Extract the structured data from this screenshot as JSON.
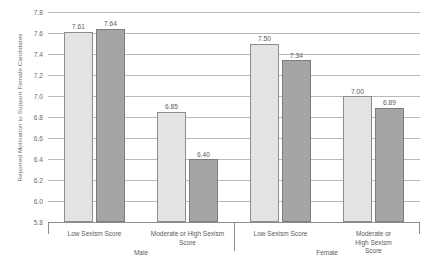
{
  "chart_data": {
    "type": "bar",
    "title": "",
    "xlabel": "",
    "ylabel": "Reported Motivation to Support Female Candidates",
    "ylim": [
      5.8,
      7.8
    ],
    "ytick_step": 0.2,
    "yticks": [
      "7.8",
      "7.6",
      "7.4",
      "7.2",
      "7.0",
      "6.8",
      "6.6",
      "6.4",
      "6.2",
      "6.0",
      "5.8"
    ],
    "ytick_values": [
      7.8,
      7.6,
      7.4,
      7.2,
      7.0,
      6.8,
      6.6,
      6.4,
      6.2,
      6.0,
      5.8
    ],
    "grid": true,
    "legend": "none",
    "categories": [
      "Low Sexism Score",
      "Moderate or High Sexism Score",
      "Low Sexism Score",
      "Moderate or High Sexism Score"
    ],
    "group_labels": [
      "Male",
      "Female"
    ],
    "series": [
      {
        "name": "light",
        "color": "#e3e3e3",
        "values": [
          7.61,
          7.5,
          6.85,
          7.0
        ]
      },
      {
        "name": "dark",
        "color": "#a5a5a5",
        "values": [
          7.64,
          7.34,
          6.4,
          6.89
        ]
      }
    ],
    "bars": [
      {
        "label": "7.61",
        "value": 7.61,
        "style": "light",
        "group": "Male",
        "category": "Low Sexism Score"
      },
      {
        "label": "7.64",
        "value": 7.64,
        "style": "dark",
        "group": "Male",
        "category": "Low Sexism Score"
      },
      {
        "label": "6.85",
        "value": 6.85,
        "style": "light",
        "group": "Male",
        "category": "Moderate or High Sexism Score"
      },
      {
        "label": "6.40",
        "value": 6.4,
        "style": "dark",
        "group": "Male",
        "category": "Moderate or High Sexism Score"
      },
      {
        "label": "7.50",
        "value": 7.5,
        "style": "light",
        "group": "Female",
        "category": "Low Sexism Score"
      },
      {
        "label": "7.34",
        "value": 7.34,
        "style": "dark",
        "group": "Female",
        "category": "Low Sexism Score"
      },
      {
        "label": "7.00",
        "value": 7.0,
        "style": "light",
        "group": "Female",
        "category": "Moderate or High Sexism Score"
      },
      {
        "label": "6.89",
        "value": 6.89,
        "style": "dark",
        "group": "Female",
        "category": "Moderate or High Sexism Score"
      }
    ],
    "category_lines": [
      [
        "Low Sexism Score"
      ],
      [
        "Moderate or High Sexism",
        "Score"
      ],
      [
        "Low Sexism Score"
      ],
      [
        "Moderate or High Sexism",
        "Score"
      ]
    ],
    "colors": {
      "light_bar": "#e3e3e3",
      "dark_bar": "#a5a5a5",
      "bar_border": "#8d8d8d",
      "grid": "#b9b9b9",
      "text": "#5a5a5a",
      "background": "#ffffff"
    }
  }
}
